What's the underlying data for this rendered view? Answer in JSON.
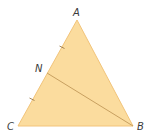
{
  "diagram": {
    "colors": {
      "fill": "#FBDC9E",
      "edge": "#F2C47A",
      "segment": "#C8A060",
      "tick": "#9C7A4A",
      "label": "#3A3A3A"
    },
    "vertices": {
      "A": {
        "label": "A",
        "x": 77,
        "y": 20
      },
      "B": {
        "label": "B",
        "x": 133,
        "y": 126
      },
      "C": {
        "label": "C",
        "x": 18,
        "y": 126
      }
    },
    "points": {
      "N": {
        "label": "N",
        "x": 47,
        "y": 73
      }
    },
    "segments": [
      {
        "from": "N",
        "to": "B"
      }
    ],
    "tick_marks": [
      {
        "on": "AN",
        "x": 62,
        "y": 47
      },
      {
        "on": "NC",
        "x": 32,
        "y": 99
      }
    ]
  }
}
